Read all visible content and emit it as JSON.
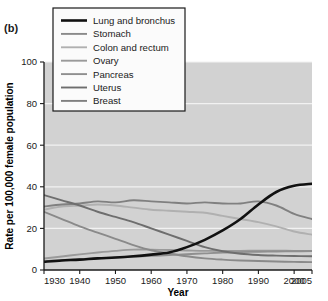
{
  "panel": {
    "label": "(b)"
  },
  "chart_data": {
    "type": "line",
    "title": "",
    "xlabel": "Year",
    "ylabel": "Rate per 100,000 female population",
    "xlim": [
      1930,
      2005
    ],
    "ylim": [
      0,
      100
    ],
    "xticks": [
      1930,
      1940,
      1950,
      1960,
      1970,
      1980,
      1990,
      2000,
      2005
    ],
    "xtick_labels": [
      "1930",
      "1940",
      "1950",
      "1960",
      "1970",
      "1980",
      "1990",
      "2000",
      "2005"
    ],
    "yticks": [
      0,
      20,
      40,
      60,
      80,
      100
    ],
    "ytick_labels": [
      "0",
      "20",
      "40",
      "60",
      "80",
      "100"
    ],
    "grid": "horizontal",
    "legend_position": "top-left",
    "plot_background": "#d2d2d2",
    "x": [
      1930,
      1935,
      1940,
      1945,
      1950,
      1955,
      1960,
      1965,
      1970,
      1975,
      1980,
      1985,
      1990,
      1995,
      2000,
      2005
    ],
    "series": [
      {
        "name": "Lung and bronchus",
        "color": "#111111",
        "width": 2.6,
        "values": [
          4.0,
          4.6,
          5.0,
          5.6,
          6.0,
          6.6,
          7.4,
          8.4,
          11.0,
          14.5,
          19.0,
          24.5,
          31.5,
          37.5,
          40.5,
          41.5
        ]
      },
      {
        "name": "Stomach",
        "color": "#8a8a8a",
        "width": 1.9,
        "values": [
          28.0,
          24.5,
          21.0,
          18.0,
          15.0,
          12.0,
          9.5,
          8.0,
          6.6,
          5.6,
          5.0,
          4.6,
          4.3,
          4.1,
          3.9,
          3.8
        ]
      },
      {
        "name": "Colon and rectum",
        "color": "#b0b0b0",
        "width": 1.9,
        "values": [
          29.0,
          30.5,
          31.0,
          31.5,
          31.0,
          30.0,
          29.0,
          28.5,
          28.0,
          27.5,
          26.0,
          24.5,
          23.0,
          21.0,
          18.5,
          17.0
        ]
      },
      {
        "name": "Ovary",
        "color": "#9a9a9a",
        "width": 1.9,
        "values": [
          5.5,
          6.5,
          7.5,
          8.4,
          9.2,
          9.8,
          9.8,
          9.6,
          9.4,
          9.2,
          9.2,
          9.2,
          9.3,
          9.3,
          9.2,
          9.2
        ]
      },
      {
        "name": "Pancreas",
        "color": "#8f8f8f",
        "width": 1.9,
        "values": [
          4.2,
          4.8,
          5.2,
          5.6,
          6.0,
          6.4,
          6.8,
          7.2,
          7.6,
          8.0,
          8.4,
          8.6,
          8.8,
          8.9,
          9.0,
          9.1
        ]
      },
      {
        "name": "Uterus",
        "color": "#6e6e6e",
        "width": 1.9,
        "values": [
          36.0,
          33.5,
          31.0,
          28.0,
          25.5,
          23.0,
          20.0,
          17.0,
          14.0,
          11.0,
          9.0,
          7.8,
          7.2,
          6.9,
          6.7,
          6.6
        ]
      },
      {
        "name": "Breast",
        "color": "#808080",
        "width": 1.9,
        "values": [
          30.5,
          31.5,
          32.0,
          33.0,
          32.5,
          33.5,
          33.0,
          32.5,
          32.0,
          32.5,
          32.0,
          32.0,
          33.0,
          31.0,
          27.0,
          24.5
        ]
      }
    ]
  },
  "legend": {
    "items": [
      {
        "label": "Lung and bronchus",
        "color": "#111111"
      },
      {
        "label": "Stomach",
        "color": "#8a8a8a"
      },
      {
        "label": "Colon and rectum",
        "color": "#b0b0b0"
      },
      {
        "label": "Ovary",
        "color": "#9a9a9a"
      },
      {
        "label": "Pancreas",
        "color": "#8f8f8f"
      },
      {
        "label": "Uterus",
        "color": "#6e6e6e"
      },
      {
        "label": "Breast",
        "color": "#808080"
      }
    ]
  }
}
